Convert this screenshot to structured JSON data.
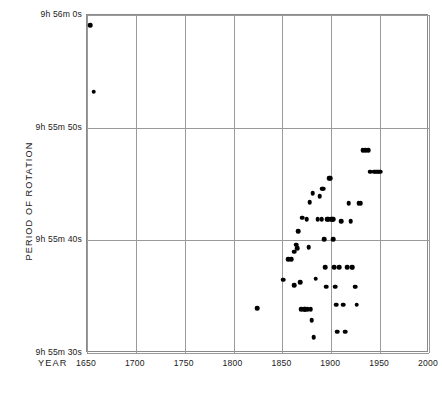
{
  "chart_data": {
    "type": "scatter",
    "title": "",
    "xlabel": "YEAR",
    "ylabel": "PERIOD OF ROTATION",
    "xlim": [
      1650,
      2000
    ],
    "ylim": [
      35730,
      35760
    ],
    "xticks": [
      1650,
      1700,
      1750,
      1800,
      1850,
      1900,
      1950,
      2000
    ],
    "xtick_labels": [
      "1650",
      "1700",
      "1750",
      "1800",
      "1850",
      "1900",
      "1950",
      "2000"
    ],
    "yticks": [
      35760,
      35750,
      35740,
      35730
    ],
    "ytick_labels": [
      "9h 56m  0s",
      "9h 55m 50s",
      "9h 55m 40s",
      "9h 55m 30s"
    ],
    "y_unit": "seconds",
    "grid": true,
    "legend": null,
    "marker": "filled-circle",
    "marker_color": "#000000",
    "points": [
      {
        "x": 1653,
        "y": 35759.1
      },
      {
        "x": 1657,
        "y": 35753.2
      },
      {
        "x": 1824,
        "y": 35734.0
      },
      {
        "x": 1851,
        "y": 35736.5
      },
      {
        "x": 1856,
        "y": 35738.3
      },
      {
        "x": 1859,
        "y": 35738.3
      },
      {
        "x": 1862,
        "y": 35739.0
      },
      {
        "x": 1862,
        "y": 35736.0
      },
      {
        "x": 1864,
        "y": 35739.6
      },
      {
        "x": 1865,
        "y": 35739.3
      },
      {
        "x": 1866,
        "y": 35740.8
      },
      {
        "x": 1868,
        "y": 35736.3
      },
      {
        "x": 1869,
        "y": 35733.9
      },
      {
        "x": 1870,
        "y": 35742.0
      },
      {
        "x": 1872,
        "y": 35733.9
      },
      {
        "x": 1873,
        "y": 35733.9
      },
      {
        "x": 1874,
        "y": 35733.9
      },
      {
        "x": 1875,
        "y": 35741.9
      },
      {
        "x": 1876,
        "y": 35733.9
      },
      {
        "x": 1877,
        "y": 35739.4
      },
      {
        "x": 1878,
        "y": 35743.4
      },
      {
        "x": 1879,
        "y": 35733.9
      },
      {
        "x": 1880,
        "y": 35732.9
      },
      {
        "x": 1881,
        "y": 35744.2
      },
      {
        "x": 1882,
        "y": 35731.4
      },
      {
        "x": 1884,
        "y": 35736.6
      },
      {
        "x": 1886,
        "y": 35741.9
      },
      {
        "x": 1888,
        "y": 35743.9
      },
      {
        "x": 1890,
        "y": 35741.9
      },
      {
        "x": 1891,
        "y": 35744.6
      },
      {
        "x": 1892,
        "y": 35744.6
      },
      {
        "x": 1893,
        "y": 35740.1
      },
      {
        "x": 1894,
        "y": 35737.6
      },
      {
        "x": 1895,
        "y": 35735.9
      },
      {
        "x": 1896,
        "y": 35741.9
      },
      {
        "x": 1897,
        "y": 35741.9
      },
      {
        "x": 1898,
        "y": 35745.5
      },
      {
        "x": 1899,
        "y": 35745.5
      },
      {
        "x": 1900,
        "y": 35741.9
      },
      {
        "x": 1901,
        "y": 35741.9
      },
      {
        "x": 1902,
        "y": 35741.9
      },
      {
        "x": 1902,
        "y": 35740.1
      },
      {
        "x": 1903,
        "y": 35737.6
      },
      {
        "x": 1904,
        "y": 35735.9
      },
      {
        "x": 1905,
        "y": 35734.3
      },
      {
        "x": 1906,
        "y": 35731.9
      },
      {
        "x": 1908,
        "y": 35737.6
      },
      {
        "x": 1910,
        "y": 35741.7
      },
      {
        "x": 1912,
        "y": 35734.3
      },
      {
        "x": 1914,
        "y": 35731.9
      },
      {
        "x": 1916,
        "y": 35737.6
      },
      {
        "x": 1918,
        "y": 35743.3
      },
      {
        "x": 1920,
        "y": 35741.7
      },
      {
        "x": 1921,
        "y": 35737.6
      },
      {
        "x": 1922,
        "y": 35737.6
      },
      {
        "x": 1924,
        "y": 35735.9
      },
      {
        "x": 1925,
        "y": 35735.9
      },
      {
        "x": 1926,
        "y": 35734.3
      },
      {
        "x": 1928,
        "y": 35743.3
      },
      {
        "x": 1930,
        "y": 35743.3
      },
      {
        "x": 1932,
        "y": 35748.0
      },
      {
        "x": 1935,
        "y": 35748.0
      },
      {
        "x": 1938,
        "y": 35748.0
      },
      {
        "x": 1940,
        "y": 35746.1
      },
      {
        "x": 1944,
        "y": 35746.1
      },
      {
        "x": 1946,
        "y": 35746.1
      },
      {
        "x": 1948,
        "y": 35746.1
      },
      {
        "x": 1950,
        "y": 35746.1
      }
    ]
  },
  "axes": {
    "x_axis_title": "YEAR",
    "y_axis_title": "PERIOD OF ROTATION"
  }
}
